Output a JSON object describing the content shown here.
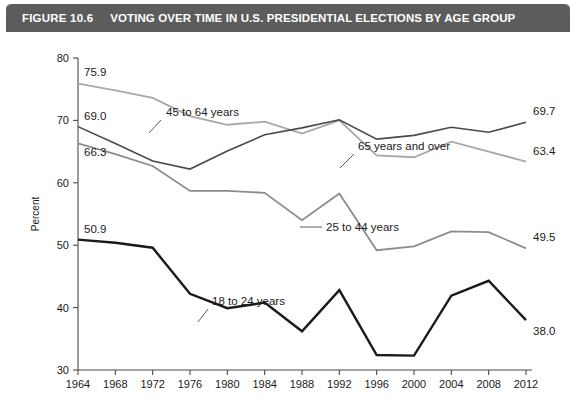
{
  "header": {
    "figure_number": "FIGURE 10.6",
    "title": "VOTING OVER TIME IN U.S. PRESIDENTIAL ELECTIONS BY AGE GROUP",
    "bar_color": "#5c5c5c"
  },
  "chart_data": {
    "type": "line",
    "title": "VOTING OVER TIME IN U.S. PRESIDENTIAL ELECTIONS BY AGE GROUP",
    "xlabel": "",
    "ylabel": "Percent",
    "x": [
      1964,
      1968,
      1972,
      1976,
      1980,
      1984,
      1988,
      1992,
      1996,
      2000,
      2004,
      2008,
      2012
    ],
    "categories": [
      "1964",
      "1968",
      "1972",
      "1976",
      "1980",
      "1984",
      "1988",
      "1992",
      "1996",
      "2000",
      "2004",
      "2008",
      "2012"
    ],
    "xlim": [
      1964,
      2012
    ],
    "ylim": [
      30,
      80
    ],
    "yticks": [
      30,
      40,
      50,
      60,
      70,
      80
    ],
    "ytick_labels": [
      "30",
      "40",
      "50",
      "60",
      "70",
      "80"
    ],
    "grid": false,
    "legend": "inline-annotations",
    "series": [
      {
        "name": "45 to 64 years",
        "color": "#a8a8a8",
        "width": 1.8,
        "start_label": "75.9",
        "end_label": "63.4",
        "values": [
          75.9,
          74.8,
          73.6,
          70.7,
          69.3,
          69.8,
          67.9,
          70.0,
          64.4,
          64.1,
          66.6,
          65.0,
          63.4
        ]
      },
      {
        "name": "65 years and over",
        "color": "#4a4a4a",
        "width": 1.6,
        "start_label": "69.0",
        "end_label": "69.7",
        "values": [
          69.0,
          66.3,
          63.5,
          62.2,
          65.1,
          67.7,
          68.8,
          70.1,
          67.0,
          67.6,
          68.9,
          68.1,
          69.7
        ]
      },
      {
        "name": "25 to 44 years",
        "color": "#8c8c8c",
        "width": 1.8,
        "start_label": "66.3",
        "end_label": "49.5",
        "values": [
          66.3,
          64.6,
          62.7,
          58.7,
          58.7,
          58.4,
          54.0,
          58.3,
          49.2,
          49.8,
          52.2,
          52.1,
          49.5
        ]
      },
      {
        "name": "18 to 24 years",
        "color": "#1a1a1a",
        "width": 2.4,
        "start_label": "50.9",
        "end_label": "38.0",
        "values": [
          50.9,
          50.4,
          49.6,
          42.2,
          39.9,
          40.8,
          36.2,
          42.8,
          32.4,
          32.3,
          41.9,
          44.3,
          38.0
        ]
      }
    ],
    "annotations": [
      {
        "text": "45 to 64 years",
        "series": "45 to 64 years"
      },
      {
        "text": "65 years and over",
        "series": "65 years and over"
      },
      {
        "text": "25 to 44 years",
        "series": "25 to 44 years"
      },
      {
        "text": "18 to 24 years",
        "series": "18 to 24 years"
      }
    ]
  }
}
